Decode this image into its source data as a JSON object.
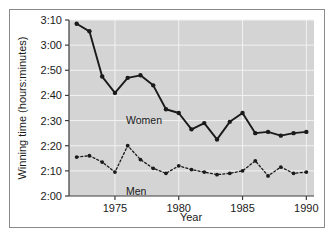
{
  "figure": {
    "background_color": "#ffffff",
    "frame_color": "#8a8a8a",
    "plot_background_color": "#d4d4d4",
    "gridline_color": "#f2f2f2",
    "axis_color": "#3c3c3c",
    "series_color": "#1a1a1a"
  },
  "chart_data": {
    "type": "line",
    "title": "",
    "xlabel": "Year",
    "ylabel": "Winning time (hours:minutes)",
    "x": [
      1972,
      1973,
      1974,
      1975,
      1976,
      1977,
      1978,
      1979,
      1980,
      1981,
      1982,
      1983,
      1984,
      1985,
      1986,
      1987,
      1988,
      1989,
      1990
    ],
    "xlim": [
      1971.4,
      1990.6
    ],
    "ylim": [
      120,
      190
    ],
    "xticks": [
      1975,
      1980,
      1985,
      1990
    ],
    "xticklabels": [
      "1975",
      "1980",
      "1985",
      "1990"
    ],
    "yticks": [
      120,
      130,
      140,
      150,
      160,
      170,
      180,
      190
    ],
    "yticklabels": [
      "2:00",
      "2:10",
      "2:20",
      "2:30",
      "2:40",
      "2:50",
      "3:00",
      "3:10"
    ],
    "grid": true,
    "legend": "inline-labels",
    "series": [
      {
        "name": "Women",
        "label": "Women",
        "line_style": "solid",
        "marker": "circle",
        "values_minutes": [
          188.5,
          185.5,
          167.5,
          161.0,
          167.0,
          168.0,
          164.0,
          154.5,
          153.0,
          146.5,
          149.0,
          142.5,
          149.5,
          153.0,
          145.0,
          145.5,
          144.0,
          145.0,
          145.5
        ],
        "values_label": [
          "3:08.5",
          "3:05.5",
          "2:47.5",
          "2:41.0",
          "2:47.0",
          "2:48.0",
          "2:44.0",
          "2:34.5",
          "2:33.0",
          "2:26.5",
          "2:29.0",
          "2:22.5",
          "2:29.5",
          "2:33.0",
          "2:25.0",
          "2:25.5",
          "2:24.0",
          "2:25.0",
          "2:25.5"
        ]
      },
      {
        "name": "Men",
        "label": "Men",
        "line_style": "dotted",
        "marker": "circle",
        "values_minutes": [
          135.5,
          136.0,
          133.5,
          129.5,
          140.0,
          134.5,
          131.0,
          129.0,
          132.0,
          130.5,
          129.5,
          128.5,
          129.0,
          130.0,
          134.0,
          128.0,
          131.5,
          129.0,
          129.5,
          128.5
        ],
        "values_label": [
          "2:15.5",
          "2:16.0",
          "2:13.5",
          "2:09.5",
          "2:20.0",
          "2:14.5",
          "2:11.0",
          "2:09.0",
          "2:12.0",
          "2:10.5",
          "2:09.5",
          "2:08.5",
          "2:09.0",
          "2:10.0",
          "2:14.0",
          "2:08.0",
          "2:11.5",
          "2:09.0",
          "2:09.5",
          "2:08.5"
        ]
      }
    ]
  }
}
